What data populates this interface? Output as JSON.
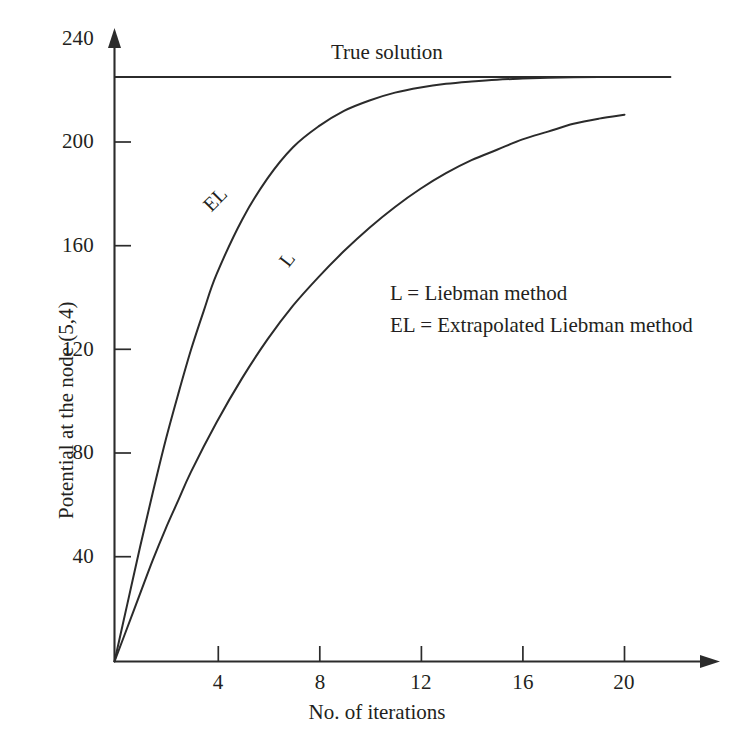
{
  "chart_data": {
    "type": "line",
    "title": "",
    "xlabel": "No. of iterations",
    "ylabel": "Potential at the node (5,4)",
    "xlim": [
      0,
      24
    ],
    "ylim": [
      0,
      240
    ],
    "xticks": [
      4,
      8,
      12,
      16,
      20
    ],
    "yticks": [
      40,
      80,
      120,
      160,
      200,
      240
    ],
    "grid": false,
    "legend_position": "inside-center-right",
    "annotations": [
      {
        "text": "True solution",
        "x": 9.0,
        "y": 240
      },
      {
        "text": "EL",
        "x": 3.6,
        "y": 178
      },
      {
        "text": "L",
        "x": 6.8,
        "y": 155
      }
    ],
    "reference_lines": [
      {
        "name": "True solution",
        "orientation": "horizontal",
        "y": 225,
        "x_start": 0,
        "x_end": 21.8
      }
    ],
    "series": [
      {
        "name": "EL",
        "label": "EL = Extrapolated Liebman method",
        "x": [
          0,
          0.5,
          1,
          1.5,
          2,
          2.5,
          3,
          3.5,
          4,
          5,
          6,
          7,
          8,
          9,
          10,
          11,
          12,
          13,
          14,
          15,
          16,
          17,
          18,
          19,
          20,
          21,
          21.8
        ],
        "y": [
          0,
          22,
          44,
          65,
          85,
          103,
          120,
          135,
          149,
          170,
          186,
          198,
          206,
          212,
          216,
          219,
          221,
          222.4,
          223.3,
          224,
          224.4,
          224.7,
          224.9,
          225,
          225,
          225,
          225
        ]
      },
      {
        "name": "L",
        "label": "L = Liebman method",
        "x": [
          0,
          0.5,
          1,
          1.5,
          2,
          2.5,
          3,
          4,
          5,
          6,
          7,
          8,
          9,
          10,
          11,
          12,
          13,
          14,
          15,
          16,
          17,
          18,
          19,
          20
        ],
        "y": [
          0,
          13,
          26,
          39,
          51,
          62,
          73,
          92,
          109,
          124,
          137,
          148,
          158,
          167,
          175,
          182,
          188,
          193,
          197,
          201,
          204,
          207,
          209,
          210.5
        ]
      }
    ]
  },
  "axes": {
    "y_title": "Potential at the node (5,4)",
    "x_title": "No. of iterations",
    "y_tick_labels": [
      "240",
      "200",
      "160",
      "120",
      "80",
      "40"
    ],
    "x_tick_labels": [
      "4",
      "8",
      "12",
      "16",
      "20"
    ]
  },
  "labels": {
    "true_solution": "True solution",
    "curve_el": "EL",
    "curve_l": "L"
  },
  "legend": {
    "entries": [
      "L = Liebman method",
      "EL = Extrapolated Liebman method"
    ]
  },
  "colors": {
    "ink": "#2b2b2b",
    "text": "#231f20",
    "background": "#ffffff"
  }
}
